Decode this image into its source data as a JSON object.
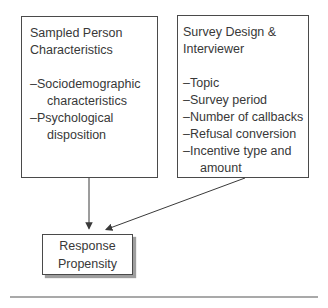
{
  "diagram": {
    "left_box": {
      "title_lines": [
        "Sampled Person",
        "Characteristics"
      ],
      "items": [
        {
          "line1": "–Sociodemographic",
          "line2": "characteristics"
        },
        {
          "line1": "–Psychological",
          "line2": "disposition"
        }
      ]
    },
    "right_box": {
      "title_lines": [
        "Survey Design &",
        "Interviewer"
      ],
      "items": [
        {
          "line1": "–Topic"
        },
        {
          "line1": "–Survey period"
        },
        {
          "line1": "–Number of callbacks"
        },
        {
          "line1": "–Refusal conversion"
        },
        {
          "line1": "–Incentive type and",
          "line2": "amount"
        }
      ]
    },
    "outcome_box": {
      "line1": "Response",
      "line2": "Propensity"
    },
    "arrows": [
      {
        "from": "sampled-person-box",
        "to": "response-propensity-box"
      },
      {
        "from": "survey-design-box",
        "to": "response-propensity-box"
      }
    ],
    "colors": {
      "box_border": "#4a4a4a",
      "text": "#383838",
      "arrow": "#3a3a3a",
      "outcome_shadow": "#9e9e9e",
      "bottom_rule": "#8d8d8d",
      "background": "#ffffff"
    }
  }
}
